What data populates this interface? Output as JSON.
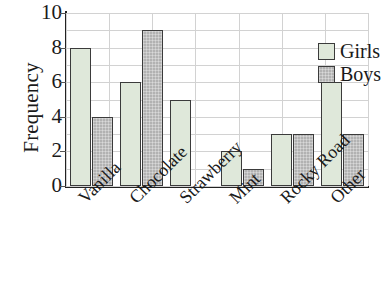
{
  "chart_data": {
    "type": "bar",
    "title": "",
    "subtitle": "",
    "xlabel": "",
    "ylabel": "Frequency",
    "categories": [
      "Vanilla",
      "Chocolate",
      "Strawberry",
      "Mint",
      "Rocky Road",
      "Other"
    ],
    "series": [
      {
        "name": "Girls",
        "values": [
          8,
          6,
          5,
          2,
          3,
          6
        ],
        "color": "#dfe8da"
      },
      {
        "name": "Boys",
        "values": [
          4,
          9,
          0,
          1,
          3,
          3
        ],
        "color": "#b2b2b2"
      }
    ],
    "ylim": [
      0,
      10
    ],
    "ytick_labels": [
      "10",
      "8",
      "6",
      "4",
      "2",
      "0"
    ],
    "ytick_values": [
      10,
      8,
      6,
      4,
      2,
      0
    ],
    "grid": true,
    "grid_color": "#d2d2d2",
    "legend_position": "top-right",
    "legend_entries": [
      "Girls",
      "Boys"
    ],
    "axis_color": "#222222",
    "bar_border_color": "#3b3b3b",
    "background_color": "#ffffff",
    "xtick_label_rotation": -45
  }
}
